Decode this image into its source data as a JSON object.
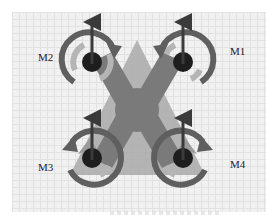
{
  "diagram": {
    "body_shape": "x-frame",
    "colors": {
      "background": "#f1f1f1",
      "grid": "#e2e2e2",
      "body_light": "#a9a9a9",
      "body_dark": "#7a7a7a",
      "ring": "#5f5f5f",
      "inner_ring": "#b5b5b5",
      "hub": "#1e1e1e",
      "thrust_arrow": "#3a3a3a"
    },
    "motors": [
      {
        "id": "M1",
        "label": "M1",
        "position": "front-right",
        "rotation": "counter-clockwise",
        "thrust": "up"
      },
      {
        "id": "M2",
        "label": "M2",
        "position": "front-left",
        "rotation": "clockwise",
        "thrust": "up"
      },
      {
        "id": "M3",
        "label": "M3",
        "position": "rear-left",
        "rotation": "counter-clockwise",
        "thrust": "up"
      },
      {
        "id": "M4",
        "label": "M4",
        "position": "rear-right",
        "rotation": "clockwise",
        "thrust": "up"
      }
    ]
  }
}
